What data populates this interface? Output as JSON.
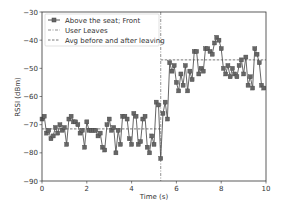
{
  "chart_data": {
    "type": "line",
    "title": "",
    "xlabel": "Time (s)",
    "ylabel": "RSSI (dBm)",
    "xlim": [
      0,
      10
    ],
    "ylim": [
      -90,
      -30
    ],
    "xticks": [
      0,
      2,
      4,
      6,
      8,
      10
    ],
    "yticks": [
      -90,
      -80,
      -70,
      -60,
      -50,
      -40,
      -30
    ],
    "grid": false,
    "legend_position": "upper left",
    "legend": [
      "Above the seat; Front",
      "User Leaves",
      "Avg before and after leaving"
    ],
    "series": [
      {
        "name": "Above the seat; Front",
        "color": "#555555",
        "marker": "square",
        "x": [
          0.0,
          0.1,
          0.2,
          0.3,
          0.4,
          0.5,
          0.6,
          0.7,
          0.8,
          0.9,
          1.0,
          1.1,
          1.2,
          1.3,
          1.4,
          1.5,
          1.6,
          1.7,
          1.8,
          1.9,
          2.0,
          2.1,
          2.2,
          2.3,
          2.4,
          2.5,
          2.6,
          2.7,
          2.8,
          2.9,
          3.0,
          3.1,
          3.2,
          3.3,
          3.4,
          3.5,
          3.6,
          3.7,
          3.8,
          3.9,
          4.0,
          4.1,
          4.2,
          4.3,
          4.4,
          4.5,
          4.6,
          4.7,
          4.8,
          4.9,
          5.0,
          5.1,
          5.2,
          5.3,
          5.4,
          5.5,
          5.6,
          5.7,
          5.8,
          5.9,
          6.0,
          6.1,
          6.2,
          6.3,
          6.4,
          6.5,
          6.6,
          6.7,
          6.8,
          6.9,
          7.0,
          7.1,
          7.2,
          7.3,
          7.4,
          7.5,
          7.6,
          7.7,
          7.8,
          7.9,
          8.0,
          8.1,
          8.2,
          8.3,
          8.4,
          8.5,
          8.6,
          8.7,
          8.8,
          8.9,
          9.0,
          9.1,
          9.2,
          9.3,
          9.4,
          9.5,
          9.6,
          9.7,
          9.8,
          9.9
        ],
        "y": [
          -68,
          -67,
          -73,
          -72,
          -75,
          -74,
          -71,
          -73,
          -70,
          -72,
          -71,
          -77,
          -68,
          -67,
          -69,
          -69,
          -70,
          -73,
          -72,
          -78,
          -69,
          -72,
          -72,
          -72,
          -72,
          -74,
          -73,
          -78,
          -79,
          -70,
          -68,
          -72,
          -71,
          -80,
          -72,
          -77,
          -67,
          -67,
          -68,
          -75,
          -77,
          -66,
          -67,
          -77,
          -76,
          -68,
          -67,
          -78,
          -80,
          -74,
          -77,
          -62,
          -63,
          -82,
          -66,
          -62,
          -68,
          -48,
          -51,
          -49,
          -55,
          -58,
          -52,
          -56,
          -49,
          -58,
          -51,
          -54,
          -44,
          -44,
          -52,
          -50,
          -51,
          -43,
          -43,
          -44,
          -45,
          -41,
          -39,
          -40,
          -43,
          -50,
          -52,
          -49,
          -53,
          -50,
          -52,
          -53,
          -49,
          -47,
          -52,
          -46,
          -56,
          -53,
          -57,
          -43,
          -45,
          -48,
          -56,
          -57
        ]
      },
      {
        "name": "User Leaves",
        "type": "vline",
        "x": 5.3,
        "color": "#555555",
        "style": "dashdot"
      },
      {
        "name": "Avg before and after leaving",
        "type": "segments",
        "style": "dashed",
        "color": "#555555",
        "segments": [
          {
            "x0": 0,
            "x1": 5.3,
            "y": -71.5
          },
          {
            "x0": 5.3,
            "x1": 10,
            "y": -47
          }
        ]
      }
    ]
  }
}
